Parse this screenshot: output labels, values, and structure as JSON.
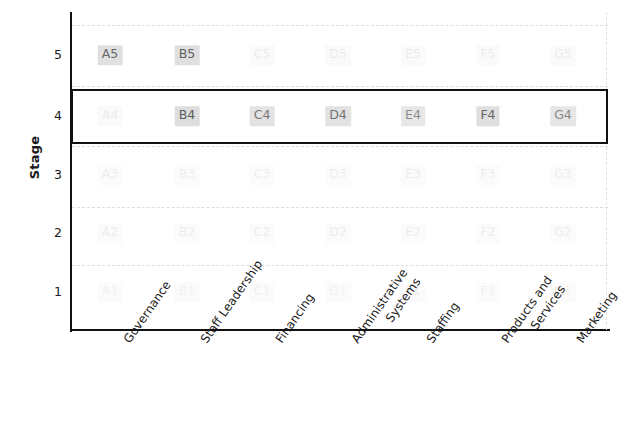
{
  "chart_data": {
    "type": "heatmap",
    "title": "",
    "xlabel": "",
    "ylabel": "Stage",
    "grid": true,
    "legend": "none",
    "ylim": [
      0.5,
      5.5
    ],
    "categories": [
      "Governance",
      "Staff Leadership",
      "Financing",
      "Administrative\nSystems",
      "Staffing",
      "Products and\nServices",
      "Marketing"
    ],
    "column_keys": [
      "A",
      "B",
      "C",
      "D",
      "E",
      "F",
      "G"
    ],
    "yticks": [
      "5",
      "4",
      "3",
      "2",
      "1"
    ],
    "rows": [
      {
        "stage": 5,
        "cells": [
          {
            "label": "A5",
            "opacity": 0.78
          },
          {
            "label": "B5",
            "opacity": 0.82
          },
          {
            "label": "C5",
            "opacity": 0.1
          },
          {
            "label": "D5",
            "opacity": 0.1
          },
          {
            "label": "E5",
            "opacity": 0.1
          },
          {
            "label": "F5",
            "opacity": 0.1
          },
          {
            "label": "G5",
            "opacity": 0.1
          }
        ]
      },
      {
        "stage": 4,
        "cells": [
          {
            "label": "A4",
            "opacity": 0.1
          },
          {
            "label": "B4",
            "opacity": 0.85
          },
          {
            "label": "C4",
            "opacity": 0.7
          },
          {
            "label": "D4",
            "opacity": 0.72
          },
          {
            "label": "E4",
            "opacity": 0.6
          },
          {
            "label": "F4",
            "opacity": 0.8
          },
          {
            "label": "G4",
            "opacity": 0.62
          }
        ]
      },
      {
        "stage": 3,
        "cells": [
          {
            "label": "A3",
            "opacity": 0.09
          },
          {
            "label": "B3",
            "opacity": 0.09
          },
          {
            "label": "C3",
            "opacity": 0.09
          },
          {
            "label": "D3",
            "opacity": 0.09
          },
          {
            "label": "E3",
            "opacity": 0.09
          },
          {
            "label": "F3",
            "opacity": 0.09
          },
          {
            "label": "G3",
            "opacity": 0.09
          }
        ]
      },
      {
        "stage": 2,
        "cells": [
          {
            "label": "A2",
            "opacity": 0.09
          },
          {
            "label": "B2",
            "opacity": 0.09
          },
          {
            "label": "C2",
            "opacity": 0.09
          },
          {
            "label": "D2",
            "opacity": 0.09
          },
          {
            "label": "E2",
            "opacity": 0.09
          },
          {
            "label": "F2",
            "opacity": 0.09
          },
          {
            "label": "G2",
            "opacity": 0.09
          }
        ]
      },
      {
        "stage": 1,
        "cells": [
          {
            "label": "A1",
            "opacity": 0.08
          },
          {
            "label": "B1",
            "opacity": 0.08
          },
          {
            "label": "C1",
            "opacity": 0.08
          },
          {
            "label": "D1",
            "opacity": 0.08
          },
          {
            "label": "E1",
            "opacity": 0.08
          },
          {
            "label": "F1",
            "opacity": 0.08
          },
          {
            "label": "G1",
            "opacity": 0.08
          }
        ]
      }
    ],
    "highlight": {
      "stage": 4,
      "color": "#111111",
      "description": "Stage 4 row outlined"
    },
    "colors": {
      "axis": "#111111",
      "gridline": "#dedede",
      "cell_fill": "#d8d8d8",
      "cell_text": "#3d3d3d",
      "highlight": "#111111"
    }
  }
}
